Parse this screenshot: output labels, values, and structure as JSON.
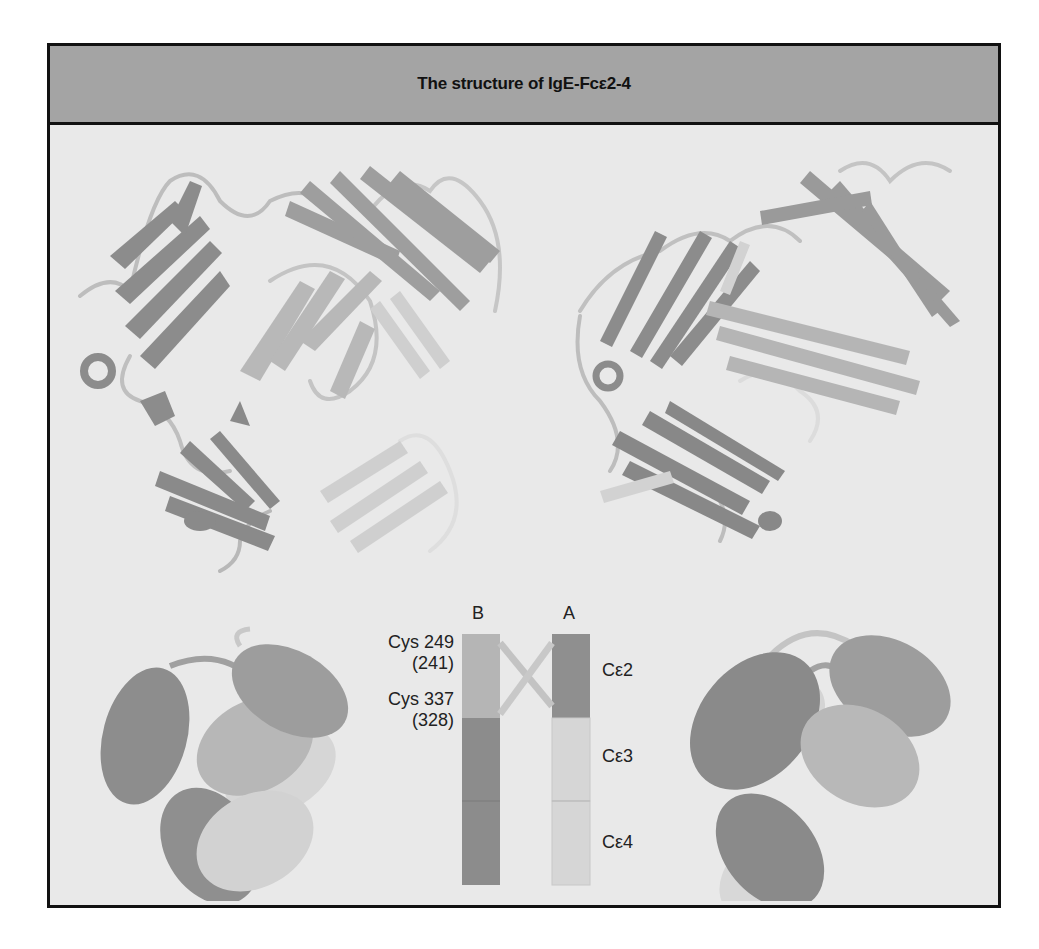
{
  "figure": {
    "title": "The structure of IgE-Fcε2-4",
    "colors": {
      "background": "#e9e9e9",
      "header": "#a4a4a4",
      "border": "#111111",
      "dark_domain": "#8a8a8a",
      "mid_domain": "#a6a6a6",
      "light_domain": "#cfcfcf"
    }
  },
  "top_panels": {
    "left_structure": "ribbon-structure-front-view",
    "right_structure": "ribbon-structure-rotated-view"
  },
  "schematic": {
    "chain_labels": {
      "B": "B",
      "A": "A"
    },
    "cys_labels": [
      {
        "line1": "Cys 249",
        "line2": "(241)"
      },
      {
        "line1": "Cys 337",
        "line2": "(328)"
      }
    ],
    "domain_labels": [
      "Cε2",
      "Cε3",
      "Cε4"
    ]
  }
}
